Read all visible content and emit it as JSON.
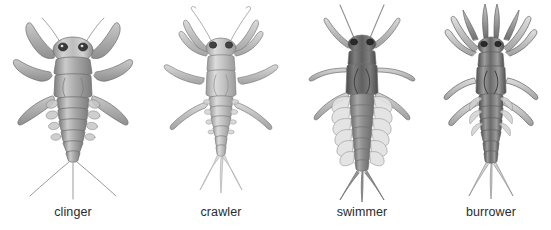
{
  "figure": {
    "background_color": "#ffffff",
    "ink_color": "#5a5a5a",
    "label_color": "#2b2b2b",
    "medium": "pencil-illustration",
    "view": "dorsal"
  },
  "specimens": [
    {
      "id": "clinger",
      "label": "clinger",
      "order": 1,
      "body_form": "broad flattened body, widely splayed sprawling legs",
      "head": "wide head with dark lateral eyes and slender antennae",
      "tails": 3,
      "tail_style": "long thin splayed cerci",
      "gills": "plate-like lateral gills on abdomen",
      "shading": "medium grey"
    },
    {
      "id": "crawler",
      "label": "crawler",
      "order": 2,
      "body_form": "slender tapering body with stout crawling legs",
      "head": "narrow head with long curved upswept antennae",
      "tails": 3,
      "tail_style": "feathered fringed cerci",
      "gills": "small lateral abdominal gills",
      "shading": "light grey"
    },
    {
      "id": "swimmer",
      "label": "swimmer",
      "order": 3,
      "body_form": "streamlined torpedo body, dark thorax, legs held back",
      "head": "small head with long straight antennae",
      "tails": 3,
      "tail_style": "broad dark paddle-like cerci",
      "gills": "prominent leaf-shaped lateral gills along abdomen",
      "shading": "dark grey thorax, pale gills"
    },
    {
      "id": "burrower",
      "label": "burrower",
      "order": 4,
      "body_form": "cylindrical body with stout digging forelegs",
      "head": "head bearing upward-projecting tusks and mandibles",
      "tails": 3,
      "tail_style": "feathered fringed cerci",
      "gills": "feathery dorsal gills folded over abdomen",
      "shading": "dark contrasty grey"
    }
  ]
}
